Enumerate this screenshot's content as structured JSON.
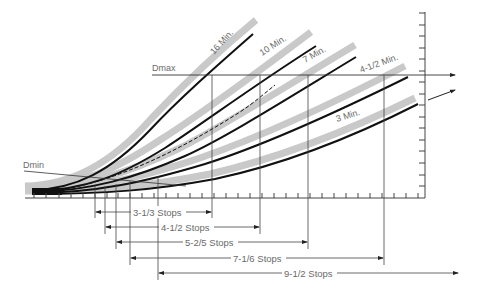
{
  "diagram": {
    "labels": {
      "dmax": "Dmax",
      "dmin": "Dmin"
    },
    "curves": [
      {
        "name": "16 Min.",
        "label_angle": -48
      },
      {
        "name": "10 Min.",
        "label_angle": -33
      },
      {
        "name": "7 Min.",
        "label_angle": -29
      },
      {
        "name": "4-1/2 Min.",
        "label_angle": -20
      },
      {
        "name": "3 Min.",
        "label_angle": -17
      }
    ],
    "stop_ranges": [
      {
        "label": "3-1/3 Stops",
        "curve": "16 Min."
      },
      {
        "label": "4-1/2 Stops",
        "curve": "10 Min."
      },
      {
        "label": "5-2/5 Stops",
        "curve": "7 Min."
      },
      {
        "label": "7-1/6 Stops",
        "curve": "4-1/2 Min."
      },
      {
        "label": "9-1/2 Stops",
        "curve": "3 Min."
      }
    ],
    "colors": {
      "curve": "#111111",
      "curve_shadow": "#c8c8c8",
      "axis": "#444444",
      "text": "#6a6a6a"
    }
  }
}
